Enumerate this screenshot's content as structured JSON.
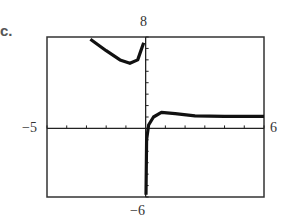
{
  "part_label": "c.",
  "chart_data": {
    "type": "line",
    "title": "",
    "xlabel": "",
    "ylabel": "",
    "window": {
      "xmin": -5,
      "xmax": 6,
      "ymin": -6,
      "ymax": 8
    },
    "xlim": [
      -5,
      6
    ],
    "ylim": [
      -6,
      8
    ],
    "tick_labels": {
      "ymax": "8",
      "ymin": "-6",
      "xmin": "-5",
      "xmax": "6"
    },
    "x_ticks": [
      -5,
      -4,
      -3,
      -2,
      -1,
      0,
      1,
      2,
      3,
      4,
      5,
      6
    ],
    "y_ticks": [
      -6,
      -5,
      -4,
      -3,
      -2,
      -1,
      0,
      1,
      2,
      3,
      4,
      5,
      6,
      7,
      8
    ],
    "grid": false,
    "series": [
      {
        "name": "left branch",
        "points": [
          [
            -2.8,
            7.8
          ],
          [
            -2.0,
            6.8
          ],
          [
            -1.3,
            6.0
          ],
          [
            -0.8,
            5.7
          ],
          [
            -0.4,
            6.0
          ],
          [
            -0.2,
            7.0
          ],
          [
            -0.1,
            7.5
          ]
        ]
      },
      {
        "name": "right branch",
        "points": [
          [
            0.02,
            -5.8
          ],
          [
            0.05,
            -1.0
          ],
          [
            0.15,
            0.3
          ],
          [
            0.4,
            1.0
          ],
          [
            0.8,
            1.4
          ],
          [
            1.5,
            1.3
          ],
          [
            2.5,
            1.1
          ],
          [
            4.0,
            1.05
          ],
          [
            6.0,
            1.05
          ]
        ]
      }
    ],
    "colors": {
      "curve": "#111111",
      "frame": "#333333",
      "axes": "#222222"
    }
  }
}
